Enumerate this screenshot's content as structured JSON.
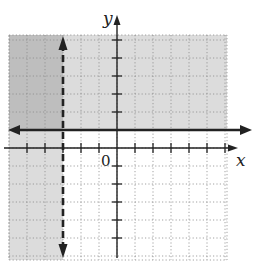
{
  "chart_data": {
    "type": "inequality-graph",
    "title": "",
    "xlabel": "x",
    "ylabel": "y",
    "origin_label": "0",
    "xlim": [
      -6,
      6
    ],
    "ylim": [
      -6,
      6
    ],
    "grid": true,
    "grid_style": "dotted",
    "tick_spacing": 1,
    "boundaries": [
      {
        "name": "vertical-dashed-boundary",
        "equation": "x = -3",
        "style": "dashed",
        "arrows": "both"
      },
      {
        "name": "horizontal-solid-boundary",
        "equation": "y = 1",
        "style": "solid",
        "arrows": "both"
      }
    ],
    "shaded_regions": [
      {
        "name": "region-above-y-1",
        "inequality": "y >= 1",
        "color": "#d9d9d9"
      },
      {
        "name": "region-left-of-x-neg3",
        "inequality": "x < -3",
        "color": "#d9d9d9"
      },
      {
        "name": "overlap-region",
        "inequality": "y >= 1 and x < -3",
        "color": "#bdbdbd"
      }
    ]
  },
  "colors": {
    "light_shade": "#dcdcdc",
    "dark_shade": "#bebebe",
    "line": "#222222",
    "grid": "#8a8a8a"
  }
}
